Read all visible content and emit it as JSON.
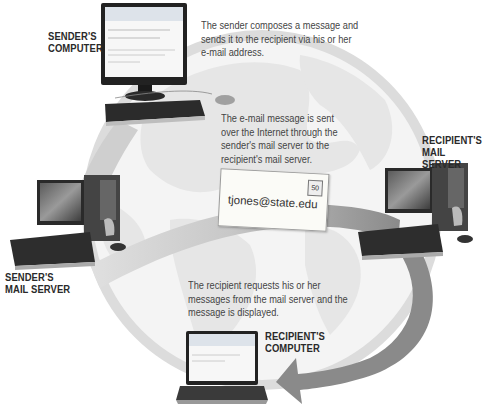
{
  "diagram": {
    "nodes": [
      {
        "id": "senders_computer",
        "label_line1": "SENDER'S",
        "label_line2": "COMPUTER",
        "icon": "desktop-computer-icon"
      },
      {
        "id": "senders_mail_server",
        "label_line1": "SENDER'S",
        "label_line2": "MAIL SERVER",
        "icon": "server-tower-icon"
      },
      {
        "id": "recipients_mail_server",
        "label_line1": "RECIPIENT'S",
        "label_line2": "MAIL SERVER",
        "icon": "server-tower-icon"
      },
      {
        "id": "recipients_computer",
        "label_line1": "RECIPIENT'S",
        "label_line2": "COMPUTER",
        "icon": "laptop-icon"
      }
    ],
    "steps": [
      {
        "lines": [
          "The sender  composes a message and",
          "sends it to the recipient via his or her",
          "e-mail address."
        ]
      },
      {
        "lines": [
          "The e-mail message is sent",
          "over the Internet through the",
          "sender's mail server to the",
          "recipient's mail server."
        ]
      },
      {
        "lines": [
          "The recipient requests his or her",
          "messages from the mail server and the",
          "message is displayed."
        ]
      }
    ],
    "envelope": {
      "address": "tjones@state.edu",
      "stamp": "50",
      "icon": "envelope-icon"
    },
    "edges": [
      {
        "from": "senders_computer",
        "to": "senders_mail_server"
      },
      {
        "from": "senders_mail_server",
        "to": "recipients_mail_server"
      },
      {
        "from": "recipients_mail_server",
        "to": "recipients_computer"
      }
    ],
    "colors": {
      "globe": "#e4e4e4",
      "globe_outline": "#d6d6d6",
      "continents": "#f2f2f2",
      "flow_light": "#d0d0d0",
      "flow_dark": "#8a8a8a",
      "label_text": "#2a2a2a",
      "desc_text": "#444444"
    }
  }
}
